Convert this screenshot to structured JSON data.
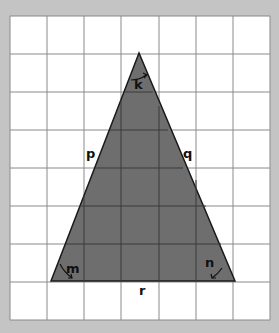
{
  "diagram": {
    "type": "triangle-on-grid",
    "grid": {
      "columns": 7,
      "rows": 8,
      "line_color": "#8a8a8a",
      "background": "#ffffff"
    },
    "triangle": {
      "fill": "#6e6e6e",
      "stroke": "#1a1a1a",
      "vertices": {
        "apex": [
          139,
          53
        ],
        "bottom_left": [
          51,
          281
        ],
        "bottom_right": [
          235,
          281
        ]
      }
    },
    "labels": {
      "angle_top": "k",
      "angle_left": "m",
      "angle_right": "n",
      "side_left": "p",
      "side_right": "q",
      "side_bottom": "r"
    }
  }
}
